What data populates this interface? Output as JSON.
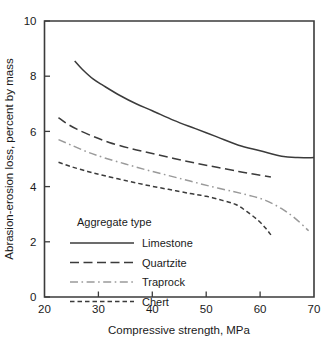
{
  "chart_data": {
    "type": "line",
    "title": "",
    "xlabel": "Compressive strength, MPa",
    "ylabel": "Abrasion-erosion loss, percent by mass",
    "xlim": [
      20,
      70
    ],
    "ylim": [
      0,
      10
    ],
    "xticks": [
      "20",
      "30",
      "40",
      "50",
      "60",
      "70"
    ],
    "xtick_values": [
      20,
      30,
      40,
      50,
      60,
      70
    ],
    "yticks": [
      "0",
      "2",
      "4",
      "6",
      "8",
      "10"
    ],
    "ytick_values": [
      0,
      2,
      4,
      6,
      8,
      10
    ],
    "grid": false,
    "legend_position": "inside-lower-left",
    "legend_title": "Aggregate type",
    "series": [
      {
        "name": "Limestone",
        "style": "solid",
        "color": "#3b3b3b",
        "x": [
          25.6,
          27.0,
          29.0,
          31.0,
          34.0,
          37.0,
          40.0,
          44.0,
          48.0,
          52.0,
          56.0,
          60.0,
          64.0,
          67.0,
          70.0
        ],
        "y": [
          8.55,
          8.25,
          7.9,
          7.65,
          7.3,
          7.0,
          6.75,
          6.4,
          6.1,
          5.8,
          5.5,
          5.3,
          5.1,
          5.05,
          5.05
        ]
      },
      {
        "name": "Quartzite",
        "style": "dashed",
        "color": "#3b3b3b",
        "x": [
          22.6,
          24.0,
          26.0,
          29.0,
          32.0,
          36.0,
          40.0,
          44.0,
          48.0,
          52.0,
          56.0,
          59.0,
          62.0
        ],
        "y": [
          6.5,
          6.3,
          6.08,
          5.82,
          5.6,
          5.38,
          5.2,
          5.02,
          4.85,
          4.7,
          4.55,
          4.45,
          4.35
        ]
      },
      {
        "name": "Traprock",
        "style": "dashdot",
        "color": "#9a9a9a",
        "x": [
          22.6,
          25.0,
          28.0,
          31.0,
          35.0,
          39.0,
          43.0,
          47.0,
          51.0,
          55.0,
          58.0,
          61.0,
          64.0,
          66.5,
          69.0
        ],
        "y": [
          5.7,
          5.5,
          5.25,
          5.05,
          4.82,
          4.6,
          4.4,
          4.2,
          4.0,
          3.82,
          3.68,
          3.5,
          3.2,
          2.85,
          2.4
        ]
      },
      {
        "name": "Chert",
        "style": "finedash",
        "color": "#3b3b3b",
        "x": [
          22.6,
          25.0,
          28.0,
          31.0,
          35.0,
          39.0,
          43.0,
          47.0,
          50.0,
          53.0,
          55.5,
          57.5,
          59.5,
          61.0,
          62.0
        ],
        "y": [
          4.88,
          4.72,
          4.55,
          4.4,
          4.22,
          4.05,
          3.9,
          3.75,
          3.65,
          3.5,
          3.35,
          3.1,
          2.8,
          2.5,
          2.25
        ]
      }
    ],
    "legend_entries": [
      {
        "label": "Limestone",
        "style": "solid",
        "color": "#3b3b3b"
      },
      {
        "label": "Quartzite",
        "style": "dashed",
        "color": "#3b3b3b"
      },
      {
        "label": "Traprock",
        "style": "dashdot",
        "color": "#9a9a9a"
      },
      {
        "label": "Chert",
        "style": "finedash",
        "color": "#3b3b3b"
      }
    ]
  },
  "colors": {
    "frame": "#3b3b3b",
    "text": "#1a1a1a",
    "background": "#ffffff",
    "accent_gray": "#9a9a9a"
  }
}
